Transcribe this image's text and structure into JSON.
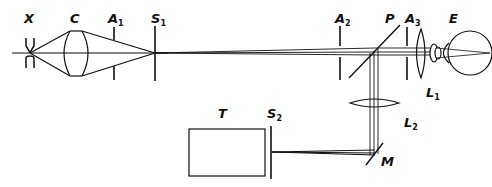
{
  "diagram": {
    "labels": {
      "X": {
        "text": "X",
        "sub": ""
      },
      "C": {
        "text": "C",
        "sub": ""
      },
      "A1": {
        "text": "A",
        "sub": "1"
      },
      "S1": {
        "text": "S",
        "sub": "1"
      },
      "A2": {
        "text": "A",
        "sub": "2"
      },
      "P": {
        "text": "P",
        "sub": ""
      },
      "A3": {
        "text": "A",
        "sub": "3"
      },
      "E": {
        "text": "E",
        "sub": ""
      },
      "L1": {
        "text": "L",
        "sub": "1"
      },
      "L2": {
        "text": "L",
        "sub": "2"
      },
      "T": {
        "text": "T",
        "sub": ""
      },
      "S2": {
        "text": "S",
        "sub": "2"
      },
      "M": {
        "text": "M",
        "sub": ""
      }
    },
    "colors": {
      "line": "#111111",
      "background": "#ffffff"
    }
  }
}
